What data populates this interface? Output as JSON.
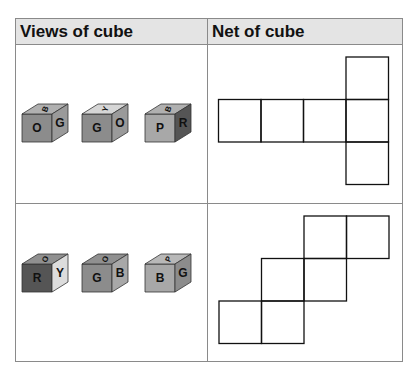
{
  "table": {
    "headers": [
      "Views of cube",
      "Net of cube"
    ],
    "rows": [
      {
        "views": [
          {
            "front": "O",
            "right": "G",
            "top": "B",
            "front_color": "#8c8c8c",
            "right_color": "#9a9a9a",
            "top_color": "#b0b0b0"
          },
          {
            "front": "G",
            "right": "O",
            "top": "Y",
            "front_color": "#8c8c8c",
            "right_color": "#9a9a9a",
            "top_color": "#d6d6d6"
          },
          {
            "front": "P",
            "right": "R",
            "top": "B",
            "front_color": "#a8a8a8",
            "right_color": "#555555",
            "top_color": "#b0b0b0"
          }
        ],
        "net": {
          "shape": "T-cross",
          "squares": [
            [
              3,
              0
            ],
            [
              0,
              1
            ],
            [
              1,
              1
            ],
            [
              2,
              1
            ],
            [
              3,
              1
            ],
            [
              3,
              2
            ]
          ]
        }
      },
      {
        "views": [
          {
            "front": "R",
            "right": "Y",
            "top": "O",
            "front_color": "#555555",
            "right_color": "#dcdcdc",
            "top_color": "#909090"
          },
          {
            "front": "G",
            "right": "B",
            "top": "O",
            "front_color": "#8c8c8c",
            "right_color": "#a8a8a8",
            "top_color": "#909090"
          },
          {
            "front": "B",
            "right": "G",
            "top": "P",
            "front_color": "#a8a8a8",
            "right_color": "#8c8c8c",
            "top_color": "#b8b8b8"
          }
        ],
        "net": {
          "shape": "staircase",
          "squares": [
            [
              2,
              0
            ],
            [
              3,
              0
            ],
            [
              1,
              1
            ],
            [
              2,
              1
            ],
            [
              0,
              2
            ],
            [
              1,
              2
            ]
          ]
        }
      }
    ]
  }
}
